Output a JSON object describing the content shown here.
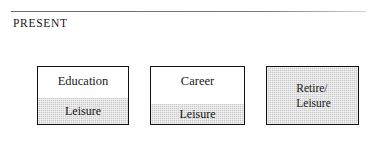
{
  "header": {
    "title": "PRESENT",
    "rule": {
      "name": "horizontal-rule",
      "color": "#6b6b6b"
    }
  },
  "diagram": {
    "type": "flow",
    "orientation": "left-to-right",
    "shade_color": "#c9c9c9",
    "border_color": "#111111",
    "stages": [
      {
        "id": "education",
        "primary_label": "Education",
        "band_label": "Leisure",
        "shaded": "partial",
        "band_position": "bottom"
      },
      {
        "id": "career",
        "primary_label": "Career",
        "band_label": "Leisure",
        "shaded": "partial",
        "band_position": "bottom"
      },
      {
        "id": "retire",
        "primary_label_line1": "Retire/",
        "primary_label_line2": "Leisure",
        "shaded": "full"
      }
    ],
    "arrows": [
      {
        "id": "entry",
        "glyph": "arrow-right"
      },
      {
        "id": "education-to-career",
        "glyph": "arrow-right"
      },
      {
        "id": "career-to-retire",
        "glyph": "arrow-right"
      }
    ]
  }
}
